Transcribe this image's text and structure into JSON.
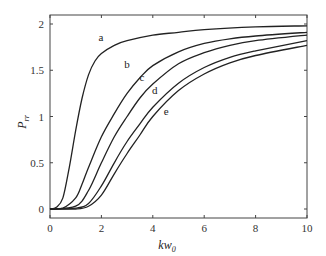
{
  "chart_data": {
    "type": "line",
    "title": "",
    "xlabel": "kw0",
    "ylabel": "Prr",
    "xlim": [
      0,
      10
    ],
    "ylim": [
      -0.1,
      2.1
    ],
    "grid": false,
    "legend": "inline labels",
    "x_ticks": [
      0,
      2,
      4,
      6,
      8,
      10
    ],
    "y_ticks": [
      0,
      0.5,
      1,
      1.5,
      2
    ],
    "x_tick_labels": [
      "0",
      "2",
      "4",
      "6",
      "8",
      "10"
    ],
    "y_tick_labels": [
      "0",
      "0.5",
      "1",
      "1.5",
      "2"
    ],
    "series": [
      {
        "name": "a",
        "label_pos": [
          1.98,
          1.82
        ],
        "x": [
          0,
          0.25,
          0.5,
          0.75,
          1,
          1.25,
          1.5,
          1.75,
          2,
          2.5,
          3,
          4,
          5,
          6,
          8,
          10
        ],
        "y": [
          0,
          0.02,
          0.12,
          0.45,
          0.85,
          1.2,
          1.45,
          1.6,
          1.68,
          1.77,
          1.82,
          1.88,
          1.91,
          1.94,
          1.97,
          1.98
        ]
      },
      {
        "name": "b",
        "label_pos": [
          3.0,
          1.52
        ],
        "x": [
          0,
          0.5,
          1,
          1.25,
          1.5,
          2,
          2.5,
          3,
          3.5,
          4,
          5,
          6,
          7,
          8,
          10
        ],
        "y": [
          0,
          0.01,
          0.12,
          0.27,
          0.45,
          0.78,
          1.03,
          1.25,
          1.42,
          1.55,
          1.7,
          1.79,
          1.84,
          1.87,
          1.91
        ]
      },
      {
        "name": "c",
        "label_pos": [
          3.58,
          1.38
        ],
        "x": [
          0,
          1,
          1.5,
          2,
          2.5,
          3,
          3.5,
          4,
          5,
          6,
          7,
          8,
          10
        ],
        "y": [
          0,
          0.03,
          0.2,
          0.5,
          0.78,
          1.0,
          1.2,
          1.35,
          1.57,
          1.69,
          1.77,
          1.82,
          1.88
        ]
      },
      {
        "name": "d",
        "label_pos": [
          4.08,
          1.24
        ],
        "x": [
          0,
          1,
          1.5,
          2,
          2.5,
          3,
          3.5,
          4,
          5,
          6,
          7,
          8,
          10
        ],
        "y": [
          0,
          0.01,
          0.06,
          0.25,
          0.5,
          0.73,
          0.92,
          1.1,
          1.36,
          1.53,
          1.64,
          1.71,
          1.82
        ]
      },
      {
        "name": "e",
        "label_pos": [
          4.52,
          1.02
        ],
        "x": [
          0,
          1,
          1.5,
          2,
          2.5,
          3,
          3.5,
          4,
          5,
          6,
          7,
          8,
          10
        ],
        "y": [
          0,
          0.0,
          0.03,
          0.15,
          0.38,
          0.6,
          0.8,
          1.0,
          1.28,
          1.46,
          1.58,
          1.66,
          1.77
        ]
      }
    ]
  },
  "axes": {
    "xlabel_main": "kw",
    "xlabel_sub": "0",
    "ylabel_main": "P",
    "ylabel_sub": "rr"
  },
  "colors": {
    "line": "#222222",
    "axis": "#444444",
    "text": "#333333"
  }
}
